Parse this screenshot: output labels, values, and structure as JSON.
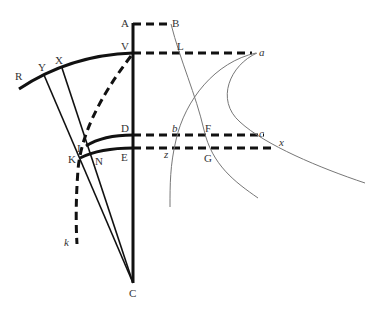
{
  "diagram": {
    "labels": {
      "A": "A",
      "B": "B",
      "V": "V",
      "L": "L",
      "a": "a",
      "R": "R",
      "Y": "Y",
      "X": "X",
      "D": "D",
      "b": "b",
      "F": "F",
      "c": "c",
      "I": "I",
      "K": "K",
      "N": "N",
      "E": "E",
      "z": "z",
      "G": "G",
      "x": "x",
      "k": "k",
      "C": "C"
    },
    "colors": {
      "heavy_line": "#111111",
      "thin_curve": "#777777",
      "label": "#333333",
      "background": "#ffffff"
    }
  }
}
